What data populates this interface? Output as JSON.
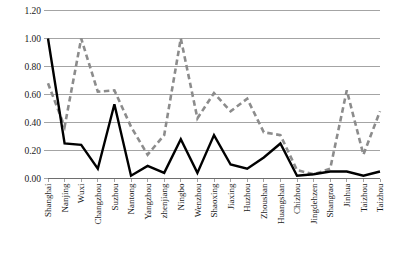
{
  "chart_data": {
    "type": "line",
    "title": "",
    "xlabel": "",
    "ylabel": "",
    "ylim": [
      0.0,
      1.2
    ],
    "ytick_labels": [
      "0.00",
      "0.20",
      "0.40",
      "0.60",
      "0.80",
      "1.00",
      "1.20"
    ],
    "ytick_values": [
      0.0,
      0.2,
      0.4,
      0.6,
      0.8,
      1.0,
      1.2
    ],
    "grid": true,
    "legend_position": "bottom",
    "categories": [
      "Shanghai",
      "Nanjing",
      "Wuxi",
      "Changzhou",
      "Suzhou",
      "Nantong",
      "Yangzhou",
      "zhenjiang",
      "Ningbo",
      "Wenzhou",
      "Shaoxing",
      "Jiaxing",
      "Huzhou",
      "Zhoushan",
      "Huangshan",
      "Chizhou",
      "Jingdehzen",
      "Shangrao",
      "Jinhua",
      "Taizhou",
      "Taizhou"
    ],
    "series": [
      {
        "name": "before improvement",
        "style": "dashed",
        "color": "#8c8c8c",
        "values": [
          0.68,
          0.37,
          1.0,
          0.62,
          0.63,
          0.37,
          0.17,
          0.31,
          1.0,
          0.43,
          0.61,
          0.48,
          0.57,
          0.33,
          0.31,
          0.06,
          0.03,
          0.07,
          0.63,
          0.17,
          0.48
        ]
      },
      {
        "name": "after improvement",
        "style": "solid",
        "color": "#000000",
        "values": [
          1.0,
          0.25,
          0.24,
          0.07,
          0.53,
          0.02,
          0.09,
          0.04,
          0.28,
          0.04,
          0.31,
          0.1,
          0.07,
          0.15,
          0.25,
          0.02,
          0.03,
          0.05,
          0.05,
          0.02,
          0.05
        ]
      }
    ]
  },
  "legend": {
    "items": [
      {
        "label": "before improvement",
        "marker": "dashed-line-marker"
      },
      {
        "label": "after improvement",
        "marker": "solid-line-marker"
      }
    ]
  }
}
